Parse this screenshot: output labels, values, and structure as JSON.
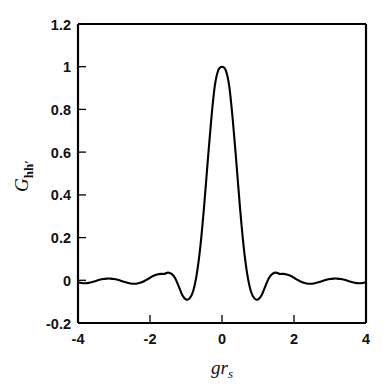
{
  "chart_data": {
    "type": "line",
    "title": "",
    "xlabel": "g r_s",
    "xlabel_parts": {
      "main": "gr",
      "sub": "s"
    },
    "ylabel": "G_hh'",
    "ylabel_parts": {
      "main": "G",
      "sub": "hh′"
    },
    "xlim": [
      -4,
      4
    ],
    "ylim": [
      -0.2,
      1.2
    ],
    "xticks": [
      -4,
      -2,
      0,
      2,
      4
    ],
    "xticklabels": [
      "-4",
      "-2",
      "0",
      "2",
      "4"
    ],
    "yticks": [
      -0.2,
      0,
      0.2,
      0.4,
      0.6,
      0.8,
      1,
      1.2
    ],
    "yticklabels": [
      "-0.2",
      "0",
      "0.2",
      "0.4",
      "0.6",
      "0.8",
      "1",
      "1.2"
    ],
    "grid": false,
    "legend": null,
    "line_color": "#000000",
    "background_color": "#ffffff",
    "series": [
      {
        "name": "G_hh'",
        "x": [
          -4.0,
          -3.9,
          -3.8,
          -3.7,
          -3.6,
          -3.5,
          -3.4,
          -3.3,
          -3.2,
          -3.1,
          -3.0,
          -2.9,
          -2.8,
          -2.7,
          -2.6,
          -2.5,
          -2.4,
          -2.3,
          -2.2,
          -2.1,
          -2.0,
          -1.9,
          -1.8,
          -1.7,
          -1.6,
          -1.5,
          -1.4,
          -1.3,
          -1.2,
          -1.1,
          -1.0,
          -0.9,
          -0.8,
          -0.7,
          -0.6,
          -0.5,
          -0.4,
          -0.3,
          -0.2,
          -0.1,
          0.0,
          0.1,
          0.2,
          0.3,
          0.4,
          0.5,
          0.6,
          0.7,
          0.8,
          0.9,
          1.0,
          1.1,
          1.2,
          1.3,
          1.4,
          1.5,
          1.6,
          1.7,
          1.8,
          1.9,
          2.0,
          2.1,
          2.2,
          2.3,
          2.4,
          2.5,
          2.6,
          2.7,
          2.8,
          2.9,
          3.0,
          3.1,
          3.2,
          3.3,
          3.4,
          3.5,
          3.6,
          3.7,
          3.8,
          3.9,
          4.0
        ],
        "y": [
          -0.01,
          -0.013,
          -0.014,
          -0.012,
          -0.008,
          -0.003,
          0.002,
          0.006,
          0.008,
          0.008,
          0.006,
          0.002,
          -0.003,
          -0.008,
          -0.013,
          -0.016,
          -0.016,
          -0.013,
          -0.007,
          0.002,
          0.012,
          0.021,
          0.027,
          0.03,
          0.03,
          0.036,
          0.03,
          0.01,
          -0.03,
          -0.07,
          -0.09,
          -0.085,
          -0.05,
          0.03,
          0.16,
          0.34,
          0.55,
          0.75,
          0.91,
          0.985,
          1.0,
          0.985,
          0.91,
          0.75,
          0.55,
          0.34,
          0.16,
          0.03,
          -0.05,
          -0.085,
          -0.09,
          -0.07,
          -0.03,
          0.01,
          0.03,
          0.036,
          0.03,
          0.03,
          0.027,
          0.021,
          0.012,
          0.002,
          -0.007,
          -0.013,
          -0.016,
          -0.016,
          -0.013,
          -0.008,
          -0.003,
          0.002,
          0.006,
          0.008,
          0.008,
          0.006,
          0.002,
          -0.003,
          -0.008,
          -0.012,
          -0.014,
          -0.013,
          -0.01
        ]
      }
    ],
    "annotations": {
      "peak_value": 1.0,
      "peak_x": 0.0,
      "first_minimum_value": -0.09,
      "first_minimum_x": [
        -1.0,
        1.0
      ],
      "first_sidelobe_value": 0.036,
      "first_sidelobe_x": [
        -1.5,
        1.5
      ]
    }
  }
}
